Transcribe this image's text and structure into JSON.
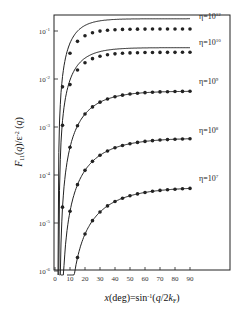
{
  "chart_data": {
    "type": "line",
    "title": "",
    "xlabel": "x(deg)=sin⁻¹(q/2k_F)",
    "ylabel": "F₁₁(q)/ε⁻²(q)",
    "xscale": "linear",
    "yscale": "log",
    "xlim": [
      0,
      90
    ],
    "ylim": [
      1e-06,
      0.2
    ],
    "x_ticks": [
      0,
      10,
      20,
      30,
      40,
      50,
      60,
      70,
      80,
      90
    ],
    "y_ticks": [
      "10⁻⁶",
      "10⁻⁵",
      "10⁻⁴",
      "10⁻³",
      "10⁻²",
      "10⁻¹"
    ],
    "grid": false,
    "legend": "inline labels at right end of each curve",
    "series": [
      {
        "name": "η=10¹²",
        "label_text": "η=10",
        "label_exp": "12",
        "x_onset": 2,
        "line_end": 0.18,
        "dots_end": 0.11,
        "dots_below_line": true
      },
      {
        "name": "η=10¹⁰",
        "label_text": "η=10",
        "label_exp": "10",
        "x_onset": 2.5,
        "line_end": 0.045,
        "dots_end": 0.036,
        "dots_below_line": true
      },
      {
        "name": "η=10⁹",
        "label_text": "η=10",
        "label_exp": "9",
        "x_onset": 3,
        "line_end": 0.0056,
        "dots_end": 0.0056,
        "dots_below_line": false
      },
      {
        "name": "η=10⁸",
        "label_text": "η=10",
        "label_exp": "8",
        "x_onset": 4,
        "line_end": 0.00059,
        "dots_end": 0.00059,
        "dots_below_line": false
      },
      {
        "name": "η=10⁷",
        "label_text": "η=10",
        "label_exp": "7",
        "x_onset": 8,
        "line_end": 5.6e-05,
        "dots_end": 5.6e-05,
        "dots_below_line": false
      }
    ],
    "dot_x": [
      5,
      10,
      15,
      20,
      25,
      30,
      35,
      40,
      45,
      50,
      55,
      60,
      65,
      70,
      75,
      80,
      85,
      90
    ]
  },
  "labels": {
    "x_axis_title": "x(deg)=sin⁻¹(q/2k_F)",
    "y_axis_title": "F₁₁(q)/ε⁻²(q)"
  }
}
